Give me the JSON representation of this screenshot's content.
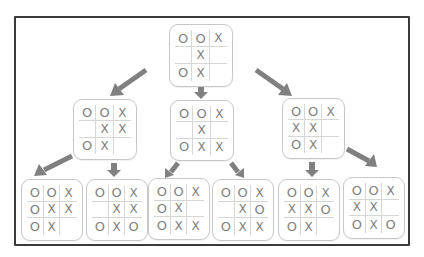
{
  "diagram": {
    "colors": {
      "frame": "#3a3a3a",
      "arrow": "#808080",
      "mark": "#7f7f7f",
      "board_border": "#c8c8c8"
    },
    "root": {
      "id": "root",
      "cells": [
        [
          "O",
          "O",
          "X"
        ],
        [
          "",
          "X",
          ""
        ],
        [
          "O",
          "X",
          ""
        ]
      ]
    },
    "level2": [
      {
        "id": "l2-left",
        "cells": [
          [
            "O",
            "O",
            "X"
          ],
          [
            "",
            "X",
            "X"
          ],
          [
            "O",
            "X",
            ""
          ]
        ]
      },
      {
        "id": "l2-middle",
        "cells": [
          [
            "O",
            "O",
            "X"
          ],
          [
            "",
            "X",
            ""
          ],
          [
            "O",
            "X",
            "X"
          ]
        ]
      },
      {
        "id": "l2-right",
        "cells": [
          [
            "O",
            "O",
            "X"
          ],
          [
            "X",
            "X",
            ""
          ],
          [
            "O",
            "X",
            ""
          ]
        ]
      }
    ],
    "leaves": [
      {
        "id": "leaf-1",
        "parent": "l2-left",
        "cells": [
          [
            "O",
            "O",
            "X"
          ],
          [
            "O",
            "X",
            "X"
          ],
          [
            "O",
            "X",
            ""
          ]
        ]
      },
      {
        "id": "leaf-2",
        "parent": "l2-left",
        "cells": [
          [
            "O",
            "O",
            "X"
          ],
          [
            "",
            "X",
            "X"
          ],
          [
            "O",
            "X",
            "O"
          ]
        ]
      },
      {
        "id": "leaf-3",
        "parent": "l2-middle",
        "cells": [
          [
            "O",
            "O",
            "X"
          ],
          [
            "O",
            "X",
            ""
          ],
          [
            "O",
            "X",
            "X"
          ]
        ]
      },
      {
        "id": "leaf-4",
        "parent": "l2-middle",
        "cells": [
          [
            "O",
            "O",
            "X"
          ],
          [
            "",
            "X",
            "O"
          ],
          [
            "O",
            "X",
            "X"
          ]
        ]
      },
      {
        "id": "leaf-5",
        "parent": "l2-right",
        "cells": [
          [
            "O",
            "O",
            "X"
          ],
          [
            "X",
            "X",
            "O"
          ],
          [
            "O",
            "X",
            ""
          ]
        ]
      },
      {
        "id": "leaf-6",
        "parent": "l2-right",
        "cells": [
          [
            "O",
            "O",
            "X"
          ],
          [
            "X",
            "X",
            ""
          ],
          [
            "O",
            "X",
            "O"
          ]
        ]
      }
    ],
    "edges": [
      {
        "from": "root",
        "to": "l2-left",
        "icon": "arrow-down-left-icon"
      },
      {
        "from": "root",
        "to": "l2-middle",
        "icon": "arrow-down-icon"
      },
      {
        "from": "root",
        "to": "l2-right",
        "icon": "arrow-down-right-icon"
      },
      {
        "from": "l2-left",
        "to": "leaf-1",
        "icon": "arrow-down-left-icon"
      },
      {
        "from": "l2-left",
        "to": "leaf-2",
        "icon": "arrow-down-icon"
      },
      {
        "from": "l2-middle",
        "to": "leaf-3",
        "icon": "arrow-down-left-icon"
      },
      {
        "from": "l2-middle",
        "to": "leaf-4",
        "icon": "arrow-down-right-icon"
      },
      {
        "from": "l2-right",
        "to": "leaf-5",
        "icon": "arrow-down-icon"
      },
      {
        "from": "l2-right",
        "to": "leaf-6",
        "icon": "arrow-down-right-icon"
      }
    ]
  }
}
